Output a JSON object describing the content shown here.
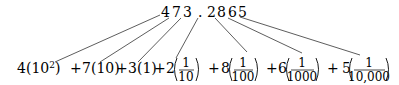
{
  "number": {
    "digits": [
      "4",
      "7",
      "3",
      ".",
      "2",
      "8",
      "6",
      "5"
    ],
    "full": "473.2865"
  },
  "expansion": {
    "terms": [
      {
        "digit": "4",
        "place": "10",
        "exponent": "2",
        "type": "power"
      },
      {
        "digit": "7",
        "place": "10",
        "type": "whole"
      },
      {
        "digit": "3",
        "place": "1",
        "type": "whole"
      },
      {
        "digit": "2",
        "numerator": "1",
        "denominator": "10",
        "type": "fraction"
      },
      {
        "digit": "8",
        "numerator": "1",
        "denominator": "100",
        "type": "fraction"
      },
      {
        "digit": "6",
        "numerator": "1",
        "denominator": "1000",
        "type": "fraction"
      },
      {
        "digit": "5",
        "numerator": "1",
        "denominator": "10,000",
        "type": "fraction"
      }
    ],
    "operator": "+"
  }
}
